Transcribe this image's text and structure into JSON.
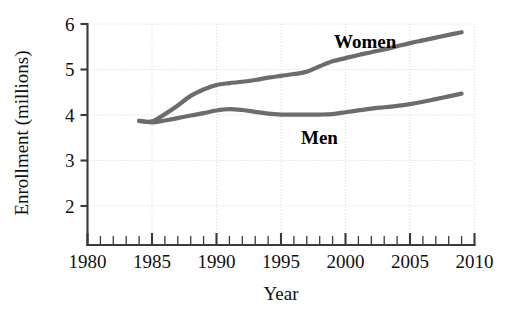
{
  "chart_data": {
    "type": "line",
    "title": "",
    "xlabel": "Year",
    "ylabel": "Enrollment (millions)",
    "xlim": [
      1980,
      2010
    ],
    "ylim": [
      1.5,
      6
    ],
    "grid": true,
    "legend_position": "inline-annotation",
    "x_ticks_major": [
      1980,
      1985,
      1990,
      1995,
      2000,
      2005,
      2010
    ],
    "x_tick_labels": [
      "1980",
      "1985",
      "1990",
      "1995",
      "2000",
      "2005",
      "2010"
    ],
    "x_minor_tick_step": 1,
    "y_ticks": [
      2,
      3,
      4,
      5,
      6
    ],
    "y_tick_labels": [
      "2",
      "3",
      "4",
      "5",
      "6"
    ],
    "x": [
      1984,
      1985,
      1986,
      1987,
      1988,
      1989,
      1990,
      1991,
      1992,
      1993,
      1994,
      1995,
      1996,
      1997,
      1998,
      1999,
      2000,
      2001,
      2002,
      2003,
      2004,
      2005,
      2006,
      2007,
      2008,
      2009
    ],
    "series": [
      {
        "name": "Women",
        "color": "#6c6c6c",
        "label": "Women",
        "values": [
          3.87,
          3.86,
          4.02,
          4.21,
          4.42,
          4.56,
          4.66,
          4.7,
          4.73,
          4.77,
          4.82,
          4.86,
          4.9,
          4.95,
          5.07,
          5.18,
          5.25,
          5.32,
          5.38,
          5.44,
          5.51,
          5.58,
          5.64,
          5.7,
          5.76,
          5.82
        ]
      },
      {
        "name": "Men",
        "color": "#6c6c6c",
        "label": "Men",
        "values": [
          3.87,
          3.84,
          3.88,
          3.93,
          3.99,
          4.04,
          4.1,
          4.13,
          4.11,
          4.07,
          4.03,
          4.01,
          4.01,
          4.01,
          4.01,
          4.02,
          4.06,
          4.1,
          4.14,
          4.17,
          4.2,
          4.24,
          4.29,
          4.35,
          4.41,
          4.47
        ]
      }
    ],
    "annotations": [
      {
        "text": "Women",
        "x_px": 334,
        "y_px": 48
      },
      {
        "text": "Men",
        "x_px": 301,
        "y_px": 144
      }
    ]
  }
}
